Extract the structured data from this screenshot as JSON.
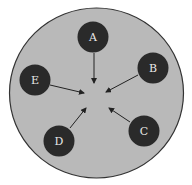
{
  "diagram": {
    "colors": {
      "background": "#ffffff",
      "outer_fill": "#b9b9b9",
      "outer_stroke": "#333333",
      "node_fill": "#2a2a2a",
      "arrow": "#222222",
      "label": "#e8e8e8"
    },
    "nodes": [
      {
        "id": "A",
        "label": "A"
      },
      {
        "id": "B",
        "label": "B"
      },
      {
        "id": "C",
        "label": "C"
      },
      {
        "id": "D",
        "label": "D"
      },
      {
        "id": "E",
        "label": "E"
      }
    ],
    "edges": [
      {
        "from": "A",
        "to": "center"
      },
      {
        "from": "B",
        "to": "center"
      },
      {
        "from": "C",
        "to": "center"
      },
      {
        "from": "D",
        "to": "center"
      },
      {
        "from": "E",
        "to": "center"
      }
    ]
  }
}
